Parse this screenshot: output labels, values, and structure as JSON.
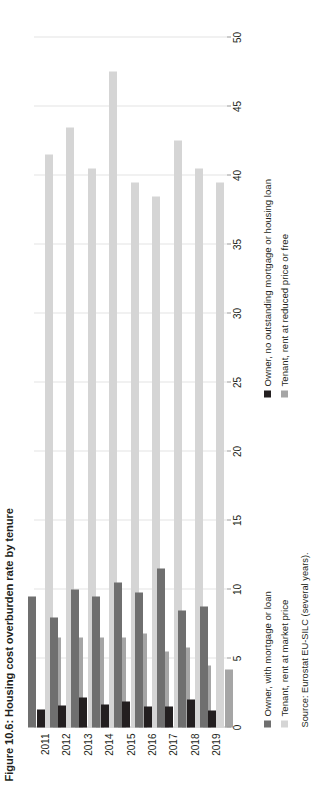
{
  "figure": {
    "title": "Figure 10.6: Housing cost overburden rate by tenure",
    "source": "Source: Eurostat EU-SILC (several years)."
  },
  "legend": {
    "items": [
      {
        "label": "Owner, with mortgage or loan",
        "color": "#6f6f6f",
        "key": "own_mortgage"
      },
      {
        "label": "Owner, no outstanding mortgage or housing loan",
        "color": "#231f20",
        "key": "own_free"
      },
      {
        "label": "Tenant, rent at market price",
        "color": "#d5d5d5",
        "key": "tenant_market"
      },
      {
        "label": "Tenant, rent at reduced price or free",
        "color": "#a5a5a5",
        "key": "tenant_reduced"
      }
    ]
  },
  "axis": {
    "ticks": [
      "0",
      "5",
      "10",
      "15",
      "20",
      "25",
      "30",
      "35",
      "40",
      "45",
      "50"
    ]
  },
  "chart_data": {
    "type": "bar",
    "orientation": "horizontal",
    "title": "Figure 10.6: Housing cost overburden rate by tenure",
    "xlabel": "",
    "ylabel": "",
    "xlim": [
      0,
      50
    ],
    "grid": true,
    "legend_position": "bottom",
    "categories": [
      "2011",
      "2012",
      "2013",
      "2014",
      "2015",
      "2016",
      "2017",
      "2018",
      "2019"
    ],
    "series": [
      {
        "name": "Owner, with mortgage or loan",
        "color": "#6f6f6f",
        "values": [
          9.5,
          8.0,
          10.0,
          9.5,
          10.5,
          9.8,
          11.5,
          8.5,
          8.8
        ]
      },
      {
        "name": "Owner, no outstanding mortgage or housing loan",
        "color": "#231f20",
        "values": [
          1.3,
          1.6,
          2.2,
          1.7,
          1.9,
          1.5,
          1.5,
          2.0,
          1.2
        ]
      },
      {
        "name": "Tenant, rent at market price",
        "color": "#d5d5d5",
        "values": [
          41.5,
          43.5,
          40.5,
          47.5,
          39.5,
          38.5,
          42.5,
          40.5,
          39.5
        ]
      },
      {
        "name": "Tenant, rent at reduced price or free",
        "color": "#a5a5a5",
        "values": [
          6.5,
          6.5,
          6.5,
          6.5,
          6.8,
          5.5,
          5.8,
          4.5,
          4.2
        ]
      }
    ],
    "source": "Source: Eurostat EU-SILC (several years)."
  }
}
